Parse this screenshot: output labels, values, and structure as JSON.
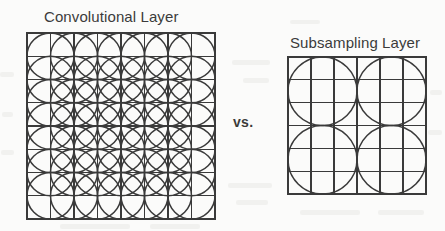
{
  "page": {
    "background_color": "#fbfbfa",
    "ink_color": "#3b3b3b",
    "width": 445,
    "height": 231
  },
  "comparison": {
    "vs_label": "vs."
  },
  "figures": [
    {
      "id": "convolutional-layer",
      "title": "Convolutional Layer",
      "grid": {
        "cols": 8,
        "rows": 8,
        "x": 0,
        "y": 0,
        "width": 188,
        "height": 186
      },
      "circles": {
        "description": "overlapping receptive fields centered on interior grid intersections",
        "radius_in_cells": 1,
        "centers_cols": [
          1,
          2,
          3,
          4,
          5,
          6,
          7
        ],
        "centers_rows": [
          1,
          2,
          3,
          4,
          5,
          6,
          7
        ],
        "count": 49
      },
      "stroke_color": "#3a3a3a",
      "grid_stroke_width": 1.2,
      "circle_stroke_width": 1.5
    },
    {
      "id": "subsampling-layer",
      "title": "Subsampling Layer",
      "grid": {
        "cols": 6,
        "rows": 6,
        "x": 0,
        "y": 0,
        "width": 138,
        "height": 137
      },
      "circles": {
        "description": "non-overlapping pooling regions",
        "radius_in_cells": 1.5,
        "centers_cols": [
          1.5,
          4.5
        ],
        "centers_rows": [
          1.5,
          4.5
        ],
        "count": 4
      },
      "stroke_color": "#3a3a3a",
      "grid_stroke_width": 1.2,
      "circle_stroke_width": 1.5
    }
  ]
}
